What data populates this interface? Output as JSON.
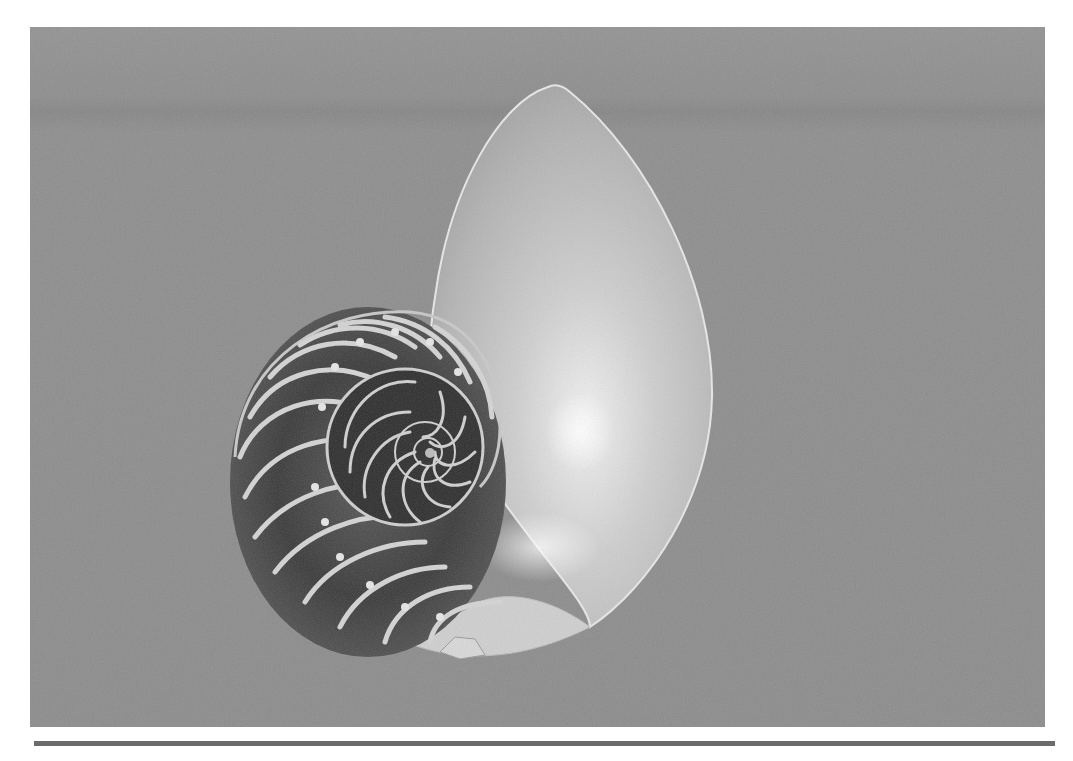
{
  "image": {
    "subject": "Nautilus shell cross-section",
    "alt": "Black and white photograph of a sectioned nautilus shell showing its logarithmic spiral chambers on a gray background",
    "background_color": "#8f8f8f",
    "shell_light_color": "#d9d9d9",
    "shell_shadow_color": "#2a2a2a",
    "frame": {
      "x": 30,
      "y": 27,
      "width": 1015,
      "height": 700
    }
  },
  "divider": {
    "color": "#6b6b6b",
    "x": 34,
    "y": 741,
    "width": 1021,
    "height": 5
  }
}
